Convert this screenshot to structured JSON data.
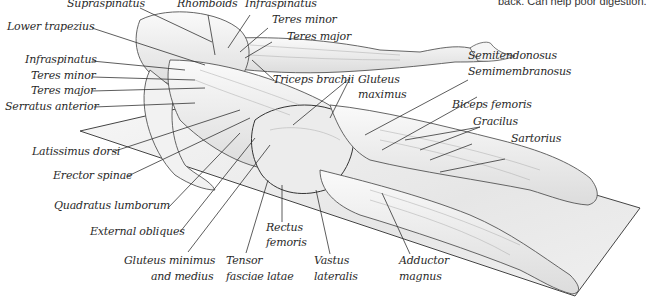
{
  "caption": "back. Can help poor digestion.",
  "figure": {
    "mat_color": "#f2f2f2",
    "line_color": "#333333"
  },
  "labels": {
    "supraspinatus": "Supraspinatus",
    "rhomboids": "Rhomboids",
    "infraspinatus_top": "Infraspinatus",
    "teres_minor_top": "Teres minor",
    "teres_major_top": "Teres major",
    "lower_trapezius": "Lower trapezius",
    "infraspinatus_left": "Infraspinatus",
    "teres_minor_left": "Teres minor",
    "teres_major_left": "Teres major",
    "serratus_anterior": "Serratus anterior",
    "triceps_brachii": "Triceps brachii",
    "gluteus_maximus_1": "Gluteus",
    "gluteus_maximus_2": "maximus",
    "semitendonosus": "Semitendonosus",
    "semimembranosus": "Semimembranosus",
    "biceps_femoris": "Biceps femoris",
    "gracilus": "Gracilus",
    "sartorius": "Sartorius",
    "latissimus_dorsi": "Latissimus dorsi",
    "erector_spinae": "Erector spinae",
    "quadratus_lumborum": "Quadratus lumborum",
    "external_obliques": "External obliques",
    "gluteus_minimus_1": "Gluteus minimus",
    "gluteus_minimus_2": "and medius",
    "rectus_femoris_1": "Rectus",
    "rectus_femoris_2": "femoris",
    "tensor_1": "Tensor",
    "tensor_2": "fasciae latae",
    "vastus_1": "Vastus",
    "vastus_2": "lateralis",
    "adductor_1": "Adductor",
    "adductor_2": "magnus"
  }
}
